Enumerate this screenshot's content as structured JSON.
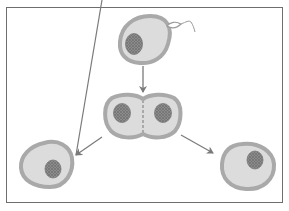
{
  "diagram": {
    "type": "biology-process",
    "frame": {
      "x": 6,
      "y": 7,
      "width": 277,
      "height": 196,
      "stroke": "#6e6e6e"
    },
    "colors": {
      "membrane": "#a9a9a9",
      "cytoplasm": "#dcdcdc",
      "nucleus": "#8c8c8c",
      "nucleus_dots": "#5a5a5a",
      "arrow": "#7a7a7a",
      "sperm": "#9a9a9a"
    },
    "stages": [
      {
        "id": "fertilized-egg",
        "description": "egg cell with nucleus and approaching sperm",
        "position": "top-center"
      },
      {
        "id": "two-cell-stage",
        "description": "dividing cell with two nuclei",
        "position": "middle-center"
      },
      {
        "id": "daughter-cell-left",
        "description": "separated daughter cell",
        "position": "bottom-left"
      },
      {
        "id": "daughter-cell-right",
        "description": "separated daughter cell",
        "position": "bottom-right"
      }
    ],
    "arrows": [
      {
        "from": "fertilized-egg",
        "to": "two-cell-stage",
        "direction": "down"
      },
      {
        "from": "two-cell-stage",
        "to": "daughter-cell-left",
        "direction": "down-left"
      },
      {
        "from": "two-cell-stage",
        "to": "daughter-cell-right",
        "direction": "down-right"
      }
    ],
    "labels": []
  }
}
